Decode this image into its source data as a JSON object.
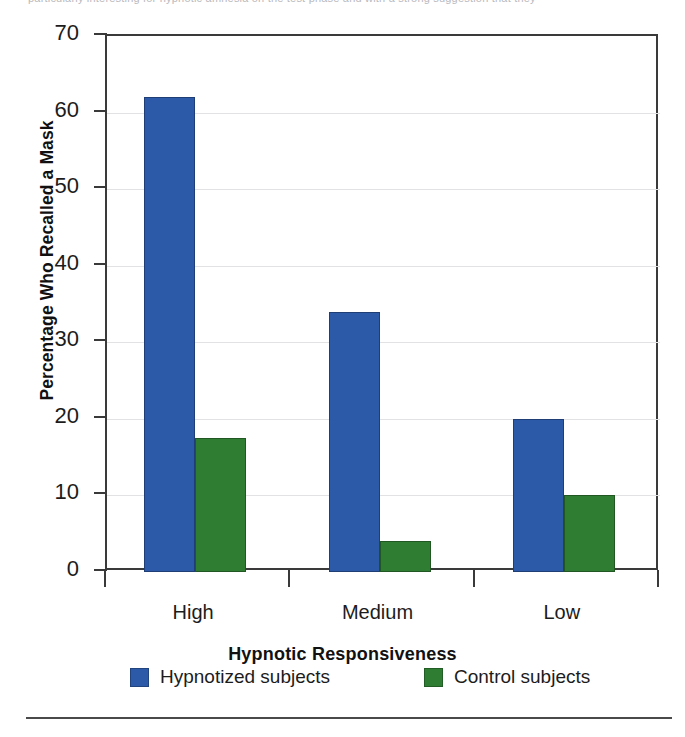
{
  "page": {
    "top_text_fragment": "particularly interesting for hypnotic amnesia     on the test phase and with a strong suggestion that they",
    "background_color": "#ffffff",
    "rule_color": "#4a4a4a"
  },
  "chart_data": {
    "type": "bar",
    "title": "",
    "subtitle": "",
    "xlabel": "Hypnotic Responsiveness",
    "ylabel": "Percentage Who Recalled a Mask",
    "categories": [
      "High",
      "Medium",
      "Low"
    ],
    "series": [
      {
        "name": "Hypnotized subjects",
        "color": "#2d5aa8",
        "values": [
          62,
          34,
          20
        ]
      },
      {
        "name": "Control subjects",
        "color": "#2e7d32",
        "values": [
          17.5,
          4,
          10
        ]
      }
    ],
    "ylim": [
      0,
      70
    ],
    "ytick_step": 10,
    "ytick_labels": [
      "0",
      "10",
      "20",
      "30",
      "40",
      "50",
      "60",
      "70"
    ],
    "ytick_values": [
      0,
      10,
      20,
      30,
      40,
      50,
      60,
      70
    ],
    "grid": true,
    "grid_color": "#e2e2e4",
    "legend_position": "bottom",
    "axis_color": "#3a3a3a"
  }
}
